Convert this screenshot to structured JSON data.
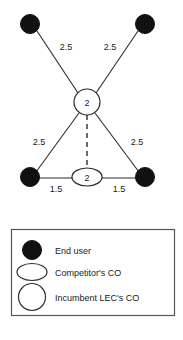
{
  "diagram": {
    "background_color": "#ffffff",
    "line_color": "#2b2b2b",
    "fill_dark": "#111111",
    "fill_light": "#ffffff",
    "nodes": [
      {
        "id": "u1",
        "type": "end-user",
        "shape": "filled-circle",
        "label": "",
        "x": 30,
        "y": 24
      },
      {
        "id": "u2",
        "type": "end-user",
        "shape": "filled-circle",
        "label": "",
        "x": 145,
        "y": 24
      },
      {
        "id": "c1",
        "type": "incumbent-lec-co",
        "shape": "open-circle",
        "label": "2",
        "x": 87,
        "y": 102
      },
      {
        "id": "u3",
        "type": "end-user",
        "shape": "filled-circle",
        "label": "",
        "x": 30,
        "y": 177
      },
      {
        "id": "u4",
        "type": "end-user",
        "shape": "filled-circle",
        "label": "",
        "x": 145,
        "y": 177
      },
      {
        "id": "c2",
        "type": "competitor-co",
        "shape": "open-ellipse",
        "label": "2",
        "x": 87,
        "y": 177
      }
    ],
    "edges": [
      {
        "from": "c1",
        "to": "u1",
        "label": "2.5",
        "style": "solid",
        "label_x": 66,
        "label_y": 50
      },
      {
        "from": "c1",
        "to": "u2",
        "label": "2.5",
        "style": "solid",
        "label_x": 110,
        "label_y": 50
      },
      {
        "from": "c1",
        "to": "u3",
        "label": "2.5",
        "style": "solid",
        "label_x": 39,
        "label_y": 145
      },
      {
        "from": "c1",
        "to": "u4",
        "label": "2.5",
        "style": "solid",
        "label_x": 137,
        "label_y": 145
      },
      {
        "from": "c1",
        "to": "c2",
        "label": "",
        "style": "dashed",
        "label_x": 0,
        "label_y": 0
      },
      {
        "from": "u3",
        "to": "c2",
        "label": "1.5",
        "style": "solid",
        "label_x": 56,
        "label_y": 192
      },
      {
        "from": "c2",
        "to": "u4",
        "label": "1.5",
        "style": "solid",
        "label_x": 119,
        "label_y": 192
      }
    ],
    "node_values": {
      "incumbent_co_value": "2",
      "competitor_co_value": "2"
    }
  },
  "legend": {
    "items": [
      {
        "symbol": "filled-circle",
        "label": "End user"
      },
      {
        "symbol": "open-ellipse",
        "label": "Competitor's CO"
      },
      {
        "symbol": "open-circle",
        "label": "Incumbent LEC's CO"
      }
    ]
  }
}
